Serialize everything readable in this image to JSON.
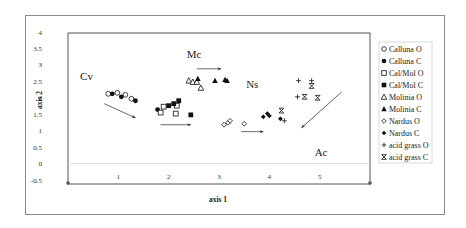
{
  "chart_data": {
    "type": "scatter",
    "title": "",
    "xlabel": "axis 1",
    "ylabel": "axis 2",
    "xlim": [
      0,
      6
    ],
    "ylim": [
      -0.5,
      4
    ],
    "x_ticks": [
      "1",
      "2",
      "3",
      "4",
      "5"
    ],
    "y_ticks": [
      "-0.5",
      "0",
      "0.5",
      "1",
      "1.5",
      "2",
      "2.5",
      "3",
      "3.5",
      "4"
    ],
    "grid": false,
    "legend_position": "right",
    "series": [
      {
        "name": "Calluna O",
        "marker": "circle-open",
        "points": [
          [
            0.8,
            2.12
          ],
          [
            0.98,
            2.15
          ],
          [
            1.14,
            2.09
          ],
          [
            1.26,
            1.97
          ]
        ]
      },
      {
        "name": "Calluna C",
        "marker": "circle-filled",
        "points": [
          [
            0.88,
            2.12
          ],
          [
            1.06,
            2.03
          ],
          [
            1.34,
            1.91
          ],
          [
            1.78,
            1.64
          ]
        ]
      },
      {
        "name": "Cal/Mol O",
        "marker": "square-open",
        "points": [
          [
            1.84,
            1.55
          ],
          [
            1.9,
            1.73
          ],
          [
            2.16,
            1.76
          ],
          [
            2.14,
            1.52
          ]
        ]
      },
      {
        "name": "Cal/Mol C",
        "marker": "square-filled",
        "points": [
          [
            2.0,
            1.76
          ],
          [
            2.1,
            1.82
          ],
          [
            2.2,
            1.91
          ],
          [
            2.44,
            1.48
          ]
        ]
      },
      {
        "name": "Molinia O",
        "marker": "triangle-open",
        "points": [
          [
            2.4,
            2.52
          ],
          [
            2.48,
            2.48
          ],
          [
            2.56,
            2.48
          ],
          [
            2.64,
            2.3
          ]
        ]
      },
      {
        "name": "Molinia C",
        "marker": "triangle-filled",
        "points": [
          [
            2.58,
            2.58
          ],
          [
            2.92,
            2.52
          ],
          [
            3.12,
            2.55
          ],
          [
            3.16,
            2.52
          ]
        ]
      },
      {
        "name": "Nardus O",
        "marker": "diamond-open",
        "points": [
          [
            3.1,
            1.18
          ],
          [
            3.18,
            1.24
          ],
          [
            3.22,
            1.3
          ],
          [
            3.5,
            1.21
          ]
        ]
      },
      {
        "name": "Nardus C",
        "marker": "diamond-filled",
        "points": [
          [
            3.88,
            1.42
          ],
          [
            3.96,
            1.52
          ],
          [
            4.0,
            1.45
          ],
          [
            4.22,
            1.36
          ]
        ]
      },
      {
        "name": "acid grass O",
        "marker": "plus",
        "points": [
          [
            4.58,
            2.52
          ],
          [
            4.84,
            2.52
          ],
          [
            4.56,
            2.03
          ],
          [
            4.3,
            1.3
          ]
        ]
      },
      {
        "name": "acid grass C",
        "marker": "asterisk",
        "points": [
          [
            4.84,
            2.36
          ],
          [
            4.7,
            2.03
          ],
          [
            4.96,
            2.0
          ],
          [
            4.24,
            1.61
          ]
        ]
      }
    ],
    "annotations": [
      {
        "text": "Cv",
        "x": 0.24,
        "y": 2.55
      },
      {
        "text": "Mc",
        "x": 2.36,
        "y": 3.2
      },
      {
        "text": "Ns",
        "x": 3.54,
        "y": 2.3
      },
      {
        "text": "Ac",
        "x": 4.9,
        "y": 0.22
      }
    ],
    "arrows": [
      {
        "from": [
          0.72,
          1.82
        ],
        "to": [
          1.34,
          1.39
        ]
      },
      {
        "from": [
          2.56,
          2.88
        ],
        "to": [
          3.04,
          2.88
        ]
      },
      {
        "from": [
          1.84,
          1.18
        ],
        "to": [
          2.44,
          1.18
        ]
      },
      {
        "from": [
          3.44,
          0.97
        ],
        "to": [
          3.88,
          0.97
        ]
      },
      {
        "from": [
          5.44,
          2.18
        ],
        "to": [
          4.64,
          1.09
        ]
      }
    ]
  }
}
